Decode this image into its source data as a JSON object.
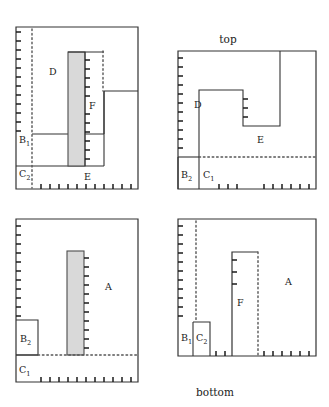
{
  "figure": {
    "type": "diagram",
    "captions": {
      "top": "top",
      "bottom": "bottom"
    },
    "colors": {
      "line": "#333333",
      "shaded_fill": "#d9d9d9",
      "shaded_stroke": "#4d4d4d",
      "text": "#1a1a1a",
      "background": "#ffffff"
    },
    "panels": [
      {
        "id": "panel-top-left",
        "position": "top-left",
        "frame": {
          "x": 16,
          "y": 27,
          "width": 122,
          "height": 162
        },
        "regions": [
          {
            "name": "D",
            "label": "D",
            "sub": "",
            "label_x": 49,
            "label_y": 75
          },
          {
            "name": "B1",
            "label": "B",
            "sub": "1",
            "label_x": 19,
            "label_y": 143
          },
          {
            "name": "C2",
            "label": "C",
            "sub": "2",
            "label_x": 19,
            "label_y": 177
          },
          {
            "name": "E",
            "label": "E",
            "sub": "",
            "label_x": 84,
            "label_y": 180
          },
          {
            "name": "F",
            "label": "F",
            "sub": "",
            "label_x": 89,
            "label_y": 109
          }
        ],
        "shaded_bar": {
          "x": 68,
          "y": 52,
          "width": 17,
          "height": 114
        },
        "dotted_lines": [
          {
            "orientation": "vertical",
            "x": 32,
            "y1": 29,
            "y2": 188
          },
          {
            "orientation": "vertical",
            "x": 103,
            "y1": 51,
            "y2": 91
          }
        ],
        "tick_edges": [
          "left",
          "bottom",
          "inner-vertical-at-85"
        ]
      },
      {
        "id": "panel-top-right",
        "position": "top-right",
        "caption": "top",
        "caption_x": 228,
        "caption_y": 43,
        "frame": {
          "x": 178,
          "y": 51,
          "width": 138,
          "height": 138
        },
        "regions": [
          {
            "name": "D",
            "label": "D",
            "sub": "",
            "label_x": 194,
            "label_y": 108
          },
          {
            "name": "E",
            "label": "E",
            "sub": "",
            "label_x": 257,
            "label_y": 143
          },
          {
            "name": "B2",
            "label": "B",
            "sub": "2",
            "label_x": 181,
            "label_y": 178
          },
          {
            "name": "C1",
            "label": "C",
            "sub": "1",
            "label_x": 203,
            "label_y": 178
          }
        ],
        "shaded_bar": null,
        "dotted_lines": [
          {
            "orientation": "horizontal",
            "y": 157,
            "x1": 199,
            "x2": 316
          }
        ],
        "tick_edges": [
          "left",
          "bottom",
          "inner-vertical-at-243"
        ]
      },
      {
        "id": "panel-bottom-left",
        "position": "bottom-left",
        "frame": {
          "x": 16,
          "y": 219,
          "width": 122,
          "height": 163
        },
        "regions": [
          {
            "name": "A",
            "label": "A",
            "sub": "",
            "label_x": 105,
            "label_y": 290
          },
          {
            "name": "B2",
            "label": "B",
            "sub": "2",
            "label_x": 20,
            "label_y": 342
          },
          {
            "name": "C1",
            "label": "C",
            "sub": "1",
            "label_x": 19,
            "label_y": 373
          }
        ],
        "shaded_bar": {
          "x": 67,
          "y": 251,
          "width": 17,
          "height": 104
        },
        "dotted_lines": [
          {
            "orientation": "horizontal",
            "y": 355,
            "x1": 38,
            "x2": 137
          }
        ],
        "tick_edges": [
          "left",
          "bottom",
          "inner-vertical-at-84"
        ]
      },
      {
        "id": "panel-bottom-right",
        "position": "bottom-right",
        "caption": "bottom",
        "caption_x": 215,
        "caption_y": 396,
        "frame": {
          "x": 178,
          "y": 219,
          "width": 138,
          "height": 137
        },
        "regions": [
          {
            "name": "B1",
            "label": "B",
            "sub": "1",
            "label_x": 181,
            "label_y": 341
          },
          {
            "name": "C2",
            "label": "C",
            "sub": "2",
            "label_x": 196,
            "label_y": 341
          },
          {
            "name": "F",
            "label": "F",
            "sub": "",
            "label_x": 237,
            "label_y": 306
          },
          {
            "name": "A",
            "label": "A",
            "sub": "",
            "label_x": 285,
            "label_y": 285
          }
        ],
        "shaded_bar": null,
        "dotted_lines": [
          {
            "orientation": "vertical",
            "x": 258,
            "y1": 252,
            "y2": 355
          },
          {
            "orientation": "vertical",
            "x": 196,
            "y1": 221,
            "y2": 322
          }
        ],
        "tick_edges": [
          "left",
          "bottom",
          "inner-vertical-at-232"
        ]
      }
    ]
  }
}
